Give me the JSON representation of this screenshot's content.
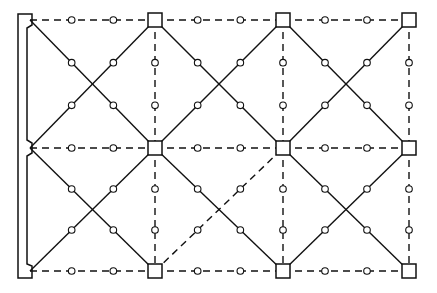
{
  "diagram": {
    "title": "",
    "grid": {
      "columns": 4,
      "rows": 3
    },
    "colors": {
      "stroke": "#111111",
      "background": "#ffffff"
    },
    "left_support": {
      "type": "notched-bar",
      "joints_at_rows": [
        0,
        1,
        2
      ]
    },
    "nodes": [
      {
        "id": "n00",
        "col": 0,
        "row": 0,
        "shape": "support-notch"
      },
      {
        "id": "n10",
        "col": 1,
        "row": 0,
        "shape": "square"
      },
      {
        "id": "n20",
        "col": 2,
        "row": 0,
        "shape": "square"
      },
      {
        "id": "n30",
        "col": 3,
        "row": 0,
        "shape": "square"
      },
      {
        "id": "n01",
        "col": 0,
        "row": 1,
        "shape": "support-notch"
      },
      {
        "id": "n11",
        "col": 1,
        "row": 1,
        "shape": "square"
      },
      {
        "id": "n21",
        "col": 2,
        "row": 1,
        "shape": "square"
      },
      {
        "id": "n31",
        "col": 3,
        "row": 1,
        "shape": "square"
      },
      {
        "id": "n02",
        "col": 0,
        "row": 2,
        "shape": "support-notch"
      },
      {
        "id": "n12",
        "col": 1,
        "row": 2,
        "shape": "square"
      },
      {
        "id": "n22",
        "col": 2,
        "row": 2,
        "shape": "square"
      },
      {
        "id": "n32",
        "col": 3,
        "row": 2,
        "shape": "square"
      }
    ],
    "edges": [
      {
        "from": "n00",
        "to": "n10",
        "style": "dashed",
        "kind": "horizontal"
      },
      {
        "from": "n10",
        "to": "n20",
        "style": "dashed",
        "kind": "horizontal"
      },
      {
        "from": "n20",
        "to": "n30",
        "style": "dashed",
        "kind": "horizontal"
      },
      {
        "from": "n01",
        "to": "n11",
        "style": "dashed",
        "kind": "horizontal"
      },
      {
        "from": "n11",
        "to": "n21",
        "style": "dashed",
        "kind": "horizontal"
      },
      {
        "from": "n21",
        "to": "n31",
        "style": "dashed",
        "kind": "horizontal"
      },
      {
        "from": "n02",
        "to": "n12",
        "style": "dashed",
        "kind": "horizontal"
      },
      {
        "from": "n12",
        "to": "n22",
        "style": "dashed",
        "kind": "horizontal"
      },
      {
        "from": "n22",
        "to": "n32",
        "style": "dashed",
        "kind": "horizontal"
      },
      {
        "from": "n10",
        "to": "n11",
        "style": "dashed",
        "kind": "vertical"
      },
      {
        "from": "n11",
        "to": "n12",
        "style": "dashed",
        "kind": "vertical"
      },
      {
        "from": "n20",
        "to": "n21",
        "style": "dashed",
        "kind": "vertical"
      },
      {
        "from": "n21",
        "to": "n22",
        "style": "dashed",
        "kind": "vertical"
      },
      {
        "from": "n30",
        "to": "n31",
        "style": "dashed",
        "kind": "vertical"
      },
      {
        "from": "n31",
        "to": "n32",
        "style": "dashed",
        "kind": "vertical"
      },
      {
        "from": "n00",
        "to": "n11",
        "style": "solid",
        "kind": "diagonal"
      },
      {
        "from": "n01",
        "to": "n10",
        "style": "solid",
        "kind": "diagonal"
      },
      {
        "from": "n10",
        "to": "n21",
        "style": "solid",
        "kind": "diagonal"
      },
      {
        "from": "n11",
        "to": "n20",
        "style": "solid",
        "kind": "diagonal"
      },
      {
        "from": "n20",
        "to": "n31",
        "style": "solid",
        "kind": "diagonal"
      },
      {
        "from": "n21",
        "to": "n30",
        "style": "solid",
        "kind": "diagonal"
      },
      {
        "from": "n01",
        "to": "n12",
        "style": "solid",
        "kind": "diagonal"
      },
      {
        "from": "n02",
        "to": "n11",
        "style": "solid",
        "kind": "diagonal"
      },
      {
        "from": "n11",
        "to": "n22",
        "style": "solid",
        "kind": "diagonal"
      },
      {
        "from": "n12",
        "to": "n21",
        "style": "dashed",
        "kind": "diagonal"
      },
      {
        "from": "n21",
        "to": "n32",
        "style": "solid",
        "kind": "diagonal"
      },
      {
        "from": "n22",
        "to": "n31",
        "style": "solid",
        "kind": "diagonal"
      }
    ],
    "intermediate_points_per_edge": 2
  }
}
